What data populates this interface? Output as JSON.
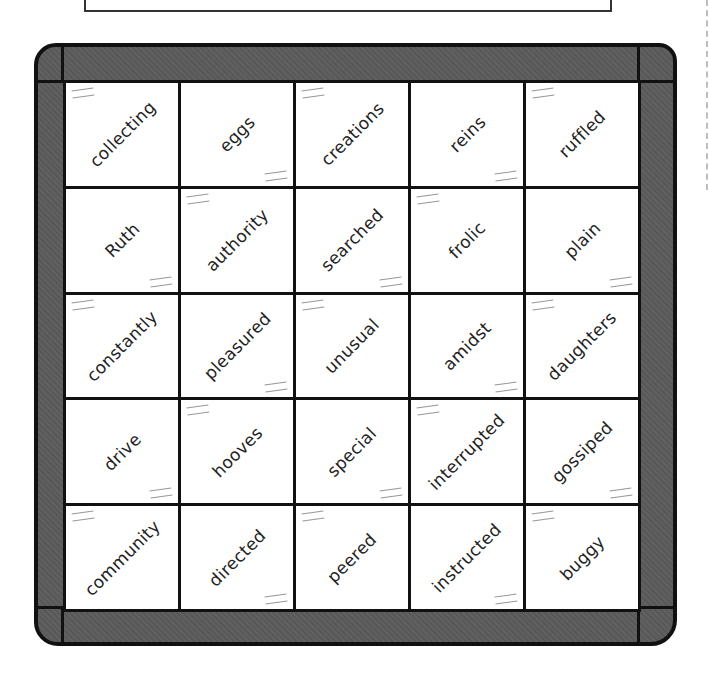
{
  "header": {
    "instruction_box_text": ""
  },
  "quilt": {
    "border_color": "#5b5b5b",
    "outline_color": "#111111",
    "rows": [
      [
        "collecting",
        "eggs",
        "creations",
        "reins",
        "ruffled"
      ],
      [
        "Ruth",
        "authority",
        "searched",
        "frolic",
        "plain"
      ],
      [
        "constantly",
        "pleasured",
        "unusual",
        "amidst",
        "daughters"
      ],
      [
        "drive",
        "hooves",
        "special",
        "interrupted",
        "gossiped"
      ],
      [
        "community",
        "directed",
        "peered",
        "instructed",
        "buggy"
      ]
    ]
  }
}
